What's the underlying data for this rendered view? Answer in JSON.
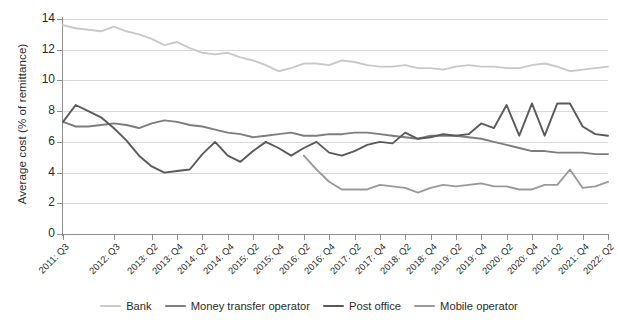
{
  "chart_data": {
    "type": "line",
    "title": "",
    "xlabel": "",
    "ylabel": "Average cost (% of remittance)",
    "ylim": [
      0,
      14
    ],
    "yticks": [
      0,
      2,
      4,
      6,
      8,
      10,
      12,
      14
    ],
    "grid": true,
    "legend_position": "bottom",
    "x": [
      "2011:Q3",
      "2011:Q4",
      "2012:Q1",
      "2012:Q2",
      "2012:Q3",
      "2012:Q4",
      "2013:Q1",
      "2013:Q2",
      "2013:Q3",
      "2013:Q4",
      "2014:Q1",
      "2014:Q2",
      "2014:Q3",
      "2014:Q4",
      "2015:Q1",
      "2015:Q2",
      "2015:Q3",
      "2015:Q4",
      "2016:Q1",
      "2016:Q2",
      "2016:Q3",
      "2016:Q4",
      "2017:Q1",
      "2017:Q2",
      "2017:Q3",
      "2017:Q4",
      "2018:Q1",
      "2018:Q2",
      "2018:Q3",
      "2018:Q4",
      "2019:Q1",
      "2019:Q2",
      "2019:Q3",
      "2019:Q4",
      "2020:Q1",
      "2020:Q2",
      "2020:Q3",
      "2020:Q4",
      "2021:Q1",
      "2021:Q2",
      "2021:Q3",
      "2021:Q4",
      "2022:Q1",
      "2022:Q2"
    ],
    "xtick_labels": [
      "2011: Q3",
      "2012: Q3",
      "2013: Q2",
      "2013: Q4",
      "2014: Q2",
      "2014: Q4",
      "2015: Q2",
      "2015: Q4",
      "2016: Q2",
      "2016: Q4",
      "2017: Q2",
      "2017: Q4",
      "2018: Q2",
      "2018: Q4",
      "2019: Q2",
      "2019: Q4",
      "2020: Q2",
      "2020: Q4",
      "2021: Q2",
      "2021: Q4",
      "2022: Q2"
    ],
    "xtick_indices": [
      0,
      4,
      7,
      9,
      11,
      13,
      15,
      17,
      19,
      21,
      23,
      25,
      27,
      29,
      31,
      33,
      35,
      37,
      39,
      41,
      43
    ],
    "series": [
      {
        "name": "Bank",
        "color": "#c9c9c9",
        "values": [
          13.6,
          13.4,
          13.3,
          13.2,
          13.5,
          13.2,
          13.0,
          12.7,
          12.3,
          12.5,
          12.1,
          11.8,
          11.7,
          11.8,
          11.5,
          11.3,
          11.0,
          10.6,
          10.8,
          11.1,
          11.1,
          11.0,
          11.3,
          11.2,
          11.0,
          10.9,
          10.9,
          11.0,
          10.8,
          10.8,
          10.7,
          10.9,
          11.0,
          10.9,
          10.9,
          10.8,
          10.8,
          11.0,
          11.1,
          10.9,
          10.6,
          10.7,
          10.8,
          10.9
        ]
      },
      {
        "name": "Money transfer operator",
        "color": "#7d7d7d",
        "values": [
          7.3,
          7.0,
          7.0,
          7.1,
          7.2,
          7.1,
          6.9,
          7.2,
          7.4,
          7.3,
          7.1,
          7.0,
          6.8,
          6.6,
          6.5,
          6.3,
          6.4,
          6.5,
          6.6,
          6.4,
          6.4,
          6.5,
          6.5,
          6.6,
          6.6,
          6.5,
          6.4,
          6.3,
          6.2,
          6.4,
          6.4,
          6.4,
          6.3,
          6.2,
          6.0,
          5.8,
          5.6,
          5.4,
          5.4,
          5.3,
          5.3,
          5.3,
          5.2,
          5.2
        ]
      },
      {
        "name": "Post office",
        "color": "#5a5a5a",
        "values": [
          7.3,
          8.4,
          8.0,
          7.6,
          6.9,
          6.1,
          5.1,
          4.4,
          4.0,
          4.1,
          4.2,
          5.2,
          6.0,
          5.1,
          4.7,
          5.4,
          6.0,
          5.6,
          5.1,
          5.6,
          6.0,
          5.3,
          5.1,
          5.4,
          5.8,
          6.0,
          5.9,
          6.6,
          6.2,
          6.3,
          6.5,
          6.4,
          6.5,
          7.2,
          6.9,
          6.9,
          7.3,
          8.2,
          8.8,
          8.7,
          8.6,
          8.7,
          8.7,
          8.4
        ]
      },
      {
        "name": "Mobile operator",
        "color": "#9a9a9a",
        "values": [
          null,
          null,
          null,
          null,
          null,
          null,
          null,
          null,
          null,
          null,
          null,
          null,
          null,
          null,
          null,
          null,
          null,
          null,
          null,
          5.1,
          4.2,
          3.4,
          2.9,
          2.9,
          2.9,
          3.2,
          3.1,
          3.0,
          2.7,
          3.0,
          3.2,
          3.1,
          3.2,
          3.3,
          3.1,
          3.1,
          2.9,
          2.9,
          3.2,
          3.2,
          4.2,
          3.0,
          3.1,
          3.4
        ]
      }
    ],
    "post_office_tail": [
      8.4,
      6.4,
      8.5,
      6.4,
      8.5,
      8.5,
      7.0,
      6.5,
      6.4
    ],
    "legend": [
      "Bank",
      "Money transfer operator",
      "Post office",
      "Mobile operator"
    ]
  },
  "top_cropped_text": ""
}
